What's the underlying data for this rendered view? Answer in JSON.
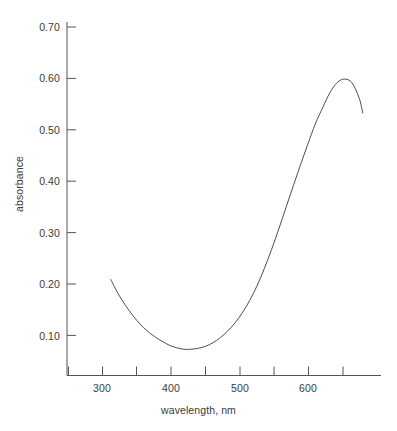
{
  "chart_data": {
    "type": "line",
    "title": "",
    "subtitle": "",
    "xlabel": "wavelength, nm",
    "ylabel": "absorbance",
    "xlim": [
      250,
      680
    ],
    "ylim": [
      0.045,
      0.745
    ],
    "grid": false,
    "legend": null,
    "x_ticks_major": [
      300,
      400,
      500,
      600
    ],
    "x_tick_labels": [
      "300",
      "400",
      "500",
      "600"
    ],
    "x_ticks_minor": [
      250,
      350,
      450,
      550,
      650
    ],
    "y_ticks_major": [
      0.1,
      0.2,
      0.3,
      0.4,
      0.5,
      0.6,
      0.7
    ],
    "y_tick_labels": [
      "0.10",
      "0.20",
      "0.30",
      "0.40",
      "0.50",
      "0.60",
      "0.70"
    ],
    "line_color": "#4d4d4d",
    "line_width": 1.0,
    "series": [
      {
        "name": "absorbance spectrum",
        "x": [
          310,
          320,
          330,
          340,
          350,
          360,
          370,
          380,
          390,
          400,
          410,
          420,
          430,
          440,
          450,
          460,
          470,
          480,
          490,
          500,
          510,
          520,
          530,
          540,
          550,
          560,
          570,
          580,
          590,
          600,
          610,
          620,
          630,
          640,
          650,
          655
        ],
        "y": [
          0.235,
          0.207,
          0.184,
          0.164,
          0.147,
          0.133,
          0.122,
          0.113,
          0.105,
          0.1,
          0.097,
          0.097,
          0.099,
          0.103,
          0.11,
          0.12,
          0.133,
          0.149,
          0.169,
          0.193,
          0.222,
          0.256,
          0.294,
          0.335,
          0.378,
          0.421,
          0.463,
          0.504,
          0.543,
          0.575,
          0.605,
          0.625,
          0.632,
          0.625,
          0.595,
          0.565
        ]
      }
    ],
    "annotations": {
      "minimum": {
        "x": 412,
        "y": 0.097
      },
      "maximum": {
        "x": 628,
        "y": 0.632
      },
      "start": {
        "x": 310,
        "y": 0.235
      },
      "end": {
        "x": 655,
        "y": 0.565
      }
    }
  },
  "axes": {
    "y_labels": [
      {
        "text": "0.70"
      },
      {
        "text": "0.60"
      },
      {
        "text": "0.50"
      },
      {
        "text": "0.40"
      },
      {
        "text": "0.30"
      },
      {
        "text": "0.20"
      },
      {
        "text": "0.10"
      }
    ],
    "x_labels": [
      {
        "text": "300"
      },
      {
        "text": "400"
      },
      {
        "text": "500"
      },
      {
        "text": "600"
      }
    ],
    "xlabel": "wavelength, nm",
    "ylabel": "absorbance"
  }
}
